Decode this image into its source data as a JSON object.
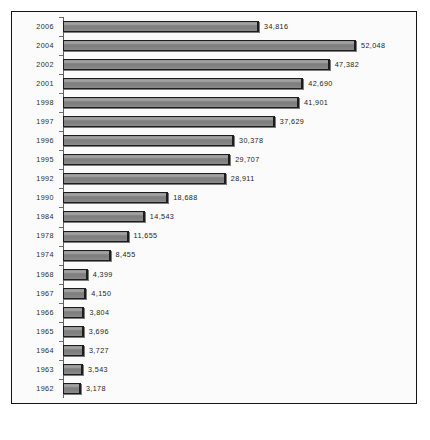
{
  "chart_data": {
    "type": "bar",
    "orientation": "horizontal",
    "title": "",
    "subtitle": "",
    "xlabel": "",
    "ylabel": "",
    "grid": false,
    "legend": null,
    "xlim": [
      0,
      52048
    ],
    "categories": [
      "2006",
      "2004",
      "2002",
      "2001",
      "1998",
      "1997",
      "1996",
      "1995",
      "1992",
      "1990",
      "1984",
      "1978",
      "1974",
      "1968",
      "1967",
      "1966",
      "1965",
      "1964",
      "1963",
      "1962"
    ],
    "values": [
      34816,
      52048,
      47382,
      42690,
      41901,
      37629,
      30378,
      29707,
      28911,
      18688,
      14543,
      11655,
      8455,
      4399,
      4150,
      3804,
      3696,
      3727,
      3543,
      3178
    ],
    "value_labels": [
      "34,816",
      "52,048",
      "47,382",
      "42,690",
      "41,901",
      "37,629",
      "30,378",
      "29,707",
      "28,911",
      "18,688",
      "14,543",
      "11,655",
      "8,455",
      "4,399",
      "4,150",
      "3,804",
      "3,696",
      "3,727",
      "3,543",
      "3,178"
    ],
    "bars": [
      {
        "category": "2006",
        "value": 34816,
        "label": "34,816"
      },
      {
        "category": "2004",
        "value": 52048,
        "label": "52,048"
      },
      {
        "category": "2002",
        "value": 47382,
        "label": "47,382"
      },
      {
        "category": "2001",
        "value": 42690,
        "label": "42,690"
      },
      {
        "category": "1998",
        "value": 41901,
        "label": "41,901"
      },
      {
        "category": "1997",
        "value": 37629,
        "label": "37,629"
      },
      {
        "category": "1996",
        "value": 30378,
        "label": "30,378"
      },
      {
        "category": "1995",
        "value": 29707,
        "label": "29,707"
      },
      {
        "category": "1992",
        "value": 28911,
        "label": "28,911"
      },
      {
        "category": "1990",
        "value": 18688,
        "label": "18,688"
      },
      {
        "category": "1984",
        "value": 14543,
        "label": "14,543"
      },
      {
        "category": "1978",
        "value": 11655,
        "label": "11,655"
      },
      {
        "category": "1974",
        "value": 8455,
        "label": "8,455"
      },
      {
        "category": "1968",
        "value": 4399,
        "label": "4,399"
      },
      {
        "category": "1967",
        "value": 4150,
        "label": "4,150"
      },
      {
        "category": "1966",
        "value": 3804,
        "label": "3,804"
      },
      {
        "category": "1965",
        "value": 3696,
        "label": "3,696"
      },
      {
        "category": "1964",
        "value": 3727,
        "label": "3,727"
      },
      {
        "category": "1963",
        "value": 3543,
        "label": "3,543"
      },
      {
        "category": "1962",
        "value": 3178,
        "label": "3,178"
      }
    ],
    "colors": {
      "bar_fill": "#858585",
      "bar_border": "#1d1d1d",
      "frame_border": "#151515",
      "background": "#fbfbfb",
      "text": "#232323",
      "axis": "#5f5f5f"
    }
  }
}
